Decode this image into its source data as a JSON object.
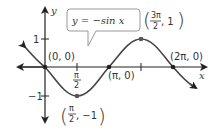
{
  "graph": {
    "equation_label": "y = −sin x",
    "axes": {
      "x_label": "x",
      "y_label": "y"
    },
    "y_ticks": [
      "1",
      "−1"
    ],
    "x_tick_labels": {
      "pi_over_2": "π",
      "pi_over_2_den": "2"
    },
    "points": [
      {
        "name": "origin",
        "label": "(0, 0)"
      },
      {
        "name": "min",
        "label_num": "π",
        "label_den": "2",
        "label_rest": ", −1"
      },
      {
        "name": "pi",
        "label": "(π, 0)"
      },
      {
        "name": "max",
        "label_num": "3π",
        "label_den": "2",
        "label_rest": ", 1"
      },
      {
        "name": "two-pi",
        "label": "(2π, 0)"
      }
    ],
    "curve_color": "#444444",
    "callout_border": "#999999"
  }
}
